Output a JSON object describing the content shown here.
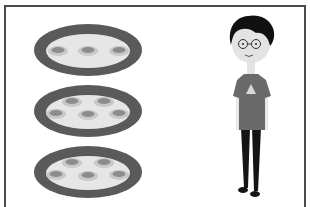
{
  "scene": {
    "description": "Illustration of three plates of food items and a cartoon person",
    "colors": {
      "frame": "#4a4a4a",
      "plate_rim": "#5a5a5a",
      "plate_center": "#e6e6e6",
      "disc_outer": "#c8c8c8",
      "disc_inner": "#8c8c8c",
      "hair": "#111111",
      "skin": "#e3e3e3",
      "shirt": "#6a6a6a",
      "pants": "#151515"
    },
    "plates": [
      {
        "id": "plate-1",
        "cx": 88,
        "cy": 50,
        "items": 3,
        "discs": [
          [
            58,
            51
          ],
          [
            88,
            51
          ],
          [
            119,
            51
          ]
        ]
      },
      {
        "id": "plate-2",
        "cx": 88,
        "cy": 111,
        "items": 5,
        "discs": [
          [
            72,
            102
          ],
          [
            104,
            102
          ],
          [
            56,
            114
          ],
          [
            88,
            115
          ],
          [
            119,
            114
          ]
        ]
      },
      {
        "id": "plate-3",
        "cx": 88,
        "cy": 172,
        "items": 5,
        "discs": [
          [
            72,
            163
          ],
          [
            104,
            163
          ],
          [
            56,
            175
          ],
          [
            88,
            176
          ],
          [
            119,
            175
          ]
        ]
      }
    ],
    "person": {
      "label": "cartoon boy with glasses"
    }
  }
}
